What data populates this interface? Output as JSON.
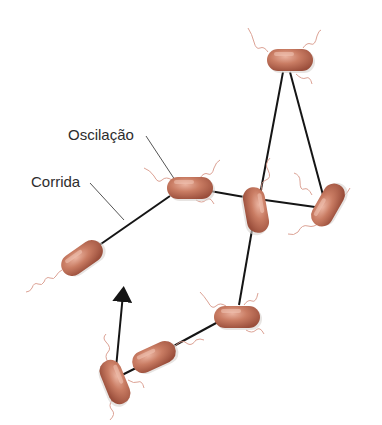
{
  "labels": {
    "tumble": "Oscilação",
    "run": "Corrida"
  },
  "colors": {
    "cell_fill": "#c77a62",
    "cell_highlight": "#e6a78f",
    "cell_shadow": "#9b4f3c",
    "flagella": "#d9998a",
    "path": "#151515",
    "leader": "#555555"
  },
  "path_points": [
    [
      290,
      60
    ],
    [
      256,
      210
    ],
    [
      328,
      205
    ],
    [
      290,
      60
    ]
  ],
  "bacteria": [
    {
      "id": "b1",
      "cx": 290,
      "cy": 60,
      "angle": 0
    },
    {
      "id": "b2",
      "cx": 190,
      "cy": 188,
      "angle": 0
    },
    {
      "id": "b3",
      "cx": 256,
      "cy": 210,
      "angle": 80
    },
    {
      "id": "b4",
      "cx": 328,
      "cy": 205,
      "angle": -60
    },
    {
      "id": "b5",
      "cx": 82,
      "cy": 258,
      "angle": -35
    },
    {
      "id": "b6",
      "cx": 237,
      "cy": 317,
      "angle": 0
    },
    {
      "id": "b7",
      "cx": 154,
      "cy": 357,
      "angle": -25
    },
    {
      "id": "b8",
      "cx": 115,
      "cy": 382,
      "angle": 70
    }
  ]
}
